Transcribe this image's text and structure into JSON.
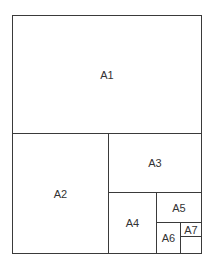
{
  "diagram": {
    "sheets": [
      {
        "label": "A1"
      },
      {
        "label": "A2"
      },
      {
        "label": "A3"
      },
      {
        "label": "A4"
      },
      {
        "label": "A5"
      },
      {
        "label": "A6"
      },
      {
        "label": "A7"
      }
    ]
  }
}
